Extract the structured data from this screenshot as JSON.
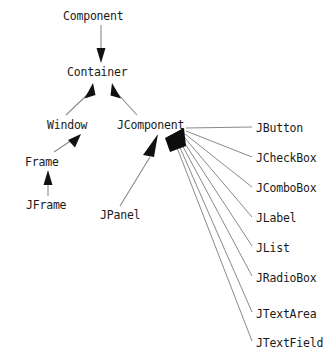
{
  "diagram": {
    "type": "class-hierarchy-uml",
    "background_color": "#ffffff",
    "text_color": "#1a1a1a",
    "edge_color": "#808080",
    "arrowhead_color": "#000000",
    "nodes": [
      {
        "id": "component",
        "label": "Component",
        "x": 63,
        "y": 10,
        "level": 0
      },
      {
        "id": "container",
        "label": "Container",
        "x": 67,
        "y": 66,
        "level": 1
      },
      {
        "id": "window",
        "label": "Window",
        "x": 47,
        "y": 119,
        "level": 2
      },
      {
        "id": "jcomponent",
        "label": "JComponent",
        "x": 117,
        "y": 119,
        "level": 2
      },
      {
        "id": "frame",
        "label": "Frame",
        "x": 25,
        "y": 156,
        "level": 3
      },
      {
        "id": "jframe",
        "label": "JFrame",
        "x": 26,
        "y": 199,
        "level": 4
      },
      {
        "id": "jpanel",
        "label": "JPanel",
        "x": 100,
        "y": 209,
        "level": 3
      },
      {
        "id": "jbutton",
        "label": "JButton",
        "x": 256,
        "y": 122,
        "level": 3
      },
      {
        "id": "jcheckbox",
        "label": "JCheckBox",
        "x": 256,
        "y": 152,
        "level": 3
      },
      {
        "id": "jcombobox",
        "label": "JComboBox",
        "x": 256,
        "y": 182,
        "level": 3
      },
      {
        "id": "jlabel",
        "label": "JLabel",
        "x": 256,
        "y": 212,
        "level": 3
      },
      {
        "id": "jlist",
        "label": "JList",
        "x": 256,
        "y": 242,
        "level": 3
      },
      {
        "id": "jradiobox",
        "label": "JRadioBox",
        "x": 256,
        "y": 272,
        "level": 3
      },
      {
        "id": "jtextarea",
        "label": "JTextArea",
        "x": 256,
        "y": 308,
        "level": 3
      },
      {
        "id": "jtextfield",
        "label": "JTextField",
        "x": 256,
        "y": 337,
        "level": 3
      }
    ],
    "edges": [
      {
        "from": "component",
        "to": "container",
        "relation": "extends"
      },
      {
        "from": "window",
        "to": "container",
        "relation": "extends"
      },
      {
        "from": "jcomponent",
        "to": "container",
        "relation": "extends"
      },
      {
        "from": "frame",
        "to": "window",
        "relation": "extends"
      },
      {
        "from": "jframe",
        "to": "frame",
        "relation": "extends"
      },
      {
        "from": "jpanel",
        "to": "jcomponent",
        "relation": "extends"
      },
      {
        "from": "jbutton",
        "to": "jcomponent",
        "relation": "extends"
      },
      {
        "from": "jcheckbox",
        "to": "jcomponent",
        "relation": "extends"
      },
      {
        "from": "jcombobox",
        "to": "jcomponent",
        "relation": "extends"
      },
      {
        "from": "jlabel",
        "to": "jcomponent",
        "relation": "extends"
      },
      {
        "from": "jlist",
        "to": "jcomponent",
        "relation": "extends"
      },
      {
        "from": "jradiobox",
        "to": "jcomponent",
        "relation": "extends"
      },
      {
        "from": "jtextarea",
        "to": "jcomponent",
        "relation": "extends"
      },
      {
        "from": "jtextfield",
        "to": "jcomponent",
        "relation": "extends"
      }
    ]
  }
}
